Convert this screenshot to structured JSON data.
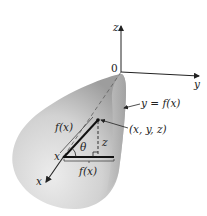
{
  "diagram": {
    "type": "solid-of-revolution",
    "colors": {
      "solid_fill_light": "#e6e6e6",
      "solid_fill_dark": "#a9a9a9",
      "axis": "#222222",
      "thick_line": "#111111"
    },
    "axes": {
      "z_label": "z",
      "y_label": "y",
      "x_label": "x",
      "origin_label": "0"
    },
    "labels": {
      "curve": "y = f(x)",
      "point": "(x, y, z)",
      "radius_slant": "f(x)",
      "radius_horizontal": "f(x)",
      "z_height": "z",
      "angle": "θ",
      "x_point": "x"
    }
  }
}
